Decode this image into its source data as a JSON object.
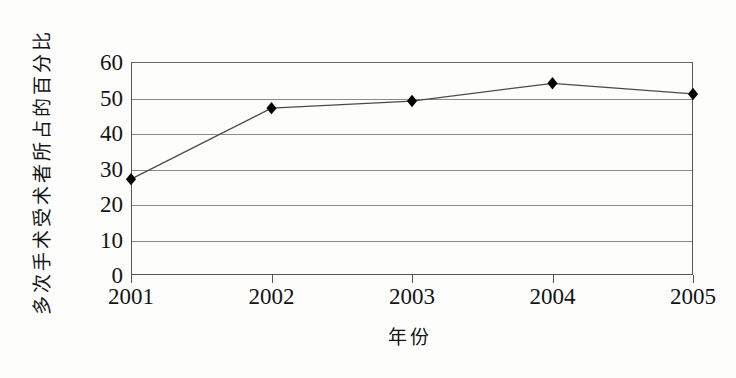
{
  "chart_data": {
    "type": "line",
    "title": "",
    "xlabel": "年份",
    "ylabel": "多次手术受术者所占的百分比",
    "categories": [
      "2001",
      "2002",
      "2003",
      "2004",
      "2005"
    ],
    "x": [
      2001,
      2002,
      2003,
      2004,
      2005
    ],
    "values": [
      27,
      47,
      49,
      54,
      51
    ],
    "series": [
      {
        "name": "多次手术受术者所占的百分比",
        "values": [
          27,
          47,
          49,
          54,
          51
        ]
      }
    ],
    "ylim": [
      0,
      60
    ],
    "y_ticks": [
      0,
      10,
      20,
      30,
      40,
      50,
      60
    ],
    "y_tick_labels": [
      "0",
      "10",
      "20",
      "30",
      "40",
      "50",
      "60"
    ],
    "x_tick_labels": [
      "2001",
      "2002",
      "2003",
      "2004",
      "2005"
    ],
    "grid": "horizontal",
    "legend": "none",
    "marker": "diamond",
    "line_color": "#4a4a4a",
    "marker_color": "#000000",
    "grid_color": "#8a8a8a",
    "axis_color": "#555555",
    "background_color": "#fdfdfc"
  }
}
